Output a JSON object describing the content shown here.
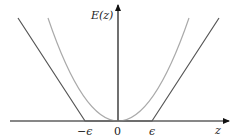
{
  "diagram": {
    "y_axis_label": "E(z)",
    "x_axis_label": "z",
    "ticks": [
      {
        "label": "−ϵ",
        "value": "-epsilon"
      },
      {
        "label": "0",
        "value": "0"
      },
      {
        "label": "ϵ",
        "value": "epsilon"
      }
    ],
    "curves": [
      {
        "name": "epsilon-insensitive",
        "color": "#555555"
      },
      {
        "name": "quadratic",
        "color": "#aaaaaa"
      }
    ],
    "axis_color": "#111111"
  }
}
